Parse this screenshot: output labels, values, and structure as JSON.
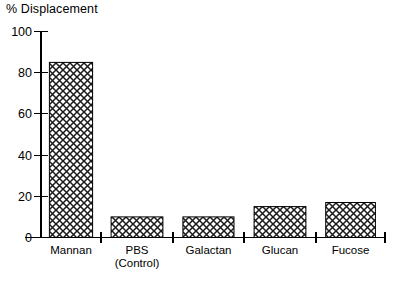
{
  "chart_data": {
    "type": "bar",
    "title": "",
    "ylabel": "% Displacement",
    "xlabel": "",
    "categories": [
      "Mannan",
      "PBS\n(Control)",
      "Galactan",
      "Glucan",
      "Fucose"
    ],
    "category_lines": [
      [
        "Mannan"
      ],
      [
        "PBS",
        "(Control)"
      ],
      [
        "Galactan"
      ],
      [
        "Glucan"
      ],
      [
        "Fucose"
      ]
    ],
    "values": [
      85,
      10,
      10,
      15,
      17
    ],
    "ylim": [
      0,
      100
    ],
    "ytick_labels": [
      "0",
      "20",
      "40",
      "60",
      "80",
      "100"
    ],
    "ytick_values": [
      0,
      20,
      40,
      60,
      80,
      100
    ],
    "grid": false,
    "legend": "none",
    "bar_fill": "crosshatch",
    "bar_edge_color": "#000000",
    "axis_color": "#000000",
    "background_color": "#ffffff"
  },
  "labels": {
    "y_axis_title": "% Displacement"
  }
}
